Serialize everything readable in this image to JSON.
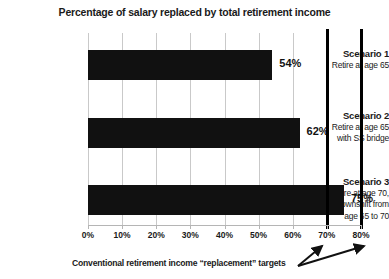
{
  "chart_data": {
    "type": "bar",
    "orientation": "horizontal",
    "title": "Percentage of salary replaced by total retirement income",
    "xlabel": "",
    "ylabel": "",
    "xlim": [
      0,
      80
    ],
    "grid": true,
    "legend": false,
    "categories": [
      "Scenario 1",
      "Scenario 2",
      "Scenario 3"
    ],
    "category_sublabels": [
      [
        "Retire at age 65"
      ],
      [
        "Retire at age 65",
        "with SS bridge"
      ],
      [
        "Retire at age 70,",
        "downshift from",
        "age  65 to 70"
      ]
    ],
    "values": [
      54,
      62,
      75
    ],
    "value_labels": [
      "54%",
      "62%",
      "75%"
    ],
    "tick_values": [
      0,
      10,
      20,
      30,
      40,
      50,
      60,
      70,
      80
    ],
    "tick_labels": [
      "0%",
      "10%",
      "20%",
      "30%",
      "40%",
      "50%",
      "60%",
      "70%",
      "80%"
    ],
    "reference_lines": [
      {
        "value": 70,
        "label": "70%"
      },
      {
        "value": 80,
        "label": "80%"
      }
    ],
    "annotation": "Conventional retirement income “replacement” targets",
    "colors": {
      "bar": "#111111",
      "grid": "#c9c9c9",
      "axis": "#b5b5b5",
      "reference_line": "#000000",
      "text": "#1a1a1a",
      "background": "#ffffff"
    }
  }
}
